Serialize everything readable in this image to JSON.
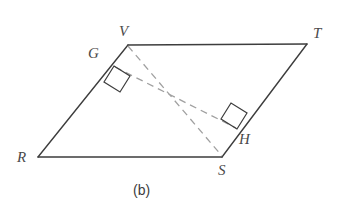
{
  "figure": {
    "caption": "(b)",
    "caption_position": {
      "x": 133,
      "y": 183
    },
    "colors": {
      "solid_stroke": "#3d3d3d",
      "dashed_stroke": "#a0a0a0",
      "label_color": "#4a4a4a",
      "background": "#ffffff"
    },
    "stroke_widths": {
      "solid": 1.4,
      "dashed": 1.3,
      "right_angle": 1.2
    },
    "dash_pattern": "7,5"
  },
  "vertices": [
    {
      "id": "V",
      "label": "V",
      "x": 128,
      "y": 45,
      "label_x": 119,
      "label_y": 24
    },
    {
      "id": "T",
      "label": "T",
      "x": 307,
      "y": 44,
      "label_x": 313,
      "label_y": 26
    },
    {
      "id": "R",
      "label": "R",
      "x": 38,
      "y": 157,
      "label_x": 17,
      "label_y": 150
    },
    {
      "id": "S",
      "label": "S",
      "x": 222,
      "y": 157,
      "label_x": 218,
      "label_y": 163
    },
    {
      "id": "G",
      "label": "G",
      "x": 114,
      "y": 66,
      "label_x": 88,
      "label_y": 46
    },
    {
      "id": "H",
      "label": "H",
      "x": 237,
      "y": 129,
      "label_x": 239,
      "label_y": 132
    }
  ],
  "solid_edges": [
    {
      "name": "edge-VT",
      "from": "V",
      "to": "T",
      "x1": 128,
      "y1": 45,
      "x2": 307,
      "y2": 44
    },
    {
      "name": "edge-RS",
      "from": "R",
      "to": "S",
      "x1": 38,
      "y1": 157,
      "x2": 222,
      "y2": 157
    },
    {
      "name": "edge-RV",
      "from": "R",
      "to": "V",
      "x1": 38,
      "y1": 157,
      "x2": 128,
      "y2": 45
    },
    {
      "name": "edge-ST",
      "from": "S",
      "to": "T",
      "x1": 222,
      "y1": 157,
      "x2": 307,
      "y2": 44
    }
  ],
  "dashed_edges": [
    {
      "name": "diagonal-VS",
      "from": "V",
      "to": "S",
      "x1": 128,
      "y1": 46,
      "x2": 222,
      "y2": 156
    },
    {
      "name": "altitude-GH",
      "from": "G",
      "to": "H",
      "x1": 115,
      "y1": 67,
      "x2": 236,
      "y2": 128
    }
  ],
  "right_angle_marks": [
    {
      "name": "right-angle-at-G",
      "at": "G",
      "points": "114,66 130,76 120,92 104,82"
    },
    {
      "name": "right-angle-at-H",
      "at": "H",
      "points": "237,129 221,119 231,103 247,113"
    }
  ]
}
